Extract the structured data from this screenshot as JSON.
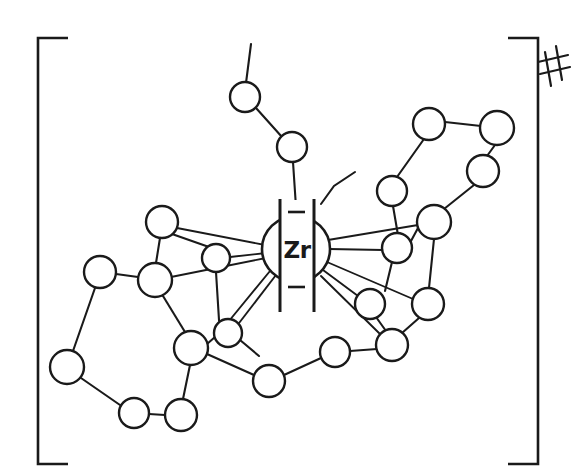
{
  "figure": {
    "kind": "chemical-structure-diagram",
    "style": "hand-drawn line drawing",
    "center_atom_label": "Zr",
    "charge_annotation": "#",
    "enclosure": "square-brackets",
    "line_color": "#1a1a1a",
    "node_fill": "#ffffff",
    "background": "#ffffff",
    "width": 588,
    "height": 475
  },
  "brackets": {
    "left": {
      "top_x": 68,
      "top_y": 37,
      "corner_x": 37,
      "bottom_y": 465,
      "bottom_x": 68
    },
    "right": {
      "top_x": 508,
      "top_y": 37,
      "corner_x": 539,
      "bottom_y": 465,
      "bottom_x": 508
    }
  },
  "charge": {
    "label": "#",
    "x": 552,
    "y": 64
  },
  "core": {
    "label": "Zr",
    "cx": 296,
    "cy": 249,
    "rx": 34,
    "ry": 33,
    "bar_left_x": 279,
    "bar_right_x": 315,
    "bar_top_y": 199,
    "bar_bottom_y": 312,
    "dash_top": {
      "x1": 288,
      "y1": 212,
      "x2": 304,
      "y2": 212
    },
    "dash_bottom": {
      "x1": 288,
      "y1": 287,
      "x2": 304,
      "y2": 287
    }
  },
  "atoms": [
    {
      "id": "a1",
      "x": 245,
      "y": 97,
      "r": 15,
      "group": "top-chain"
    },
    {
      "id": "a2",
      "x": 292,
      "y": 147,
      "r": 15,
      "group": "top-chain"
    },
    {
      "id": "a3",
      "x": 429,
      "y": 124,
      "r": 16,
      "group": "upper-right-ring"
    },
    {
      "id": "a4",
      "x": 497,
      "y": 128,
      "r": 17,
      "group": "upper-right-ring"
    },
    {
      "id": "a5",
      "x": 483,
      "y": 171,
      "r": 16,
      "group": "upper-right-ring"
    },
    {
      "id": "a6",
      "x": 392,
      "y": 191,
      "r": 15,
      "group": "upper-right-ring"
    },
    {
      "id": "a7",
      "x": 434,
      "y": 222,
      "r": 17,
      "group": "right-cluster"
    },
    {
      "id": "a8",
      "x": 397,
      "y": 248,
      "r": 15,
      "group": "right-cluster"
    },
    {
      "id": "a9",
      "x": 428,
      "y": 304,
      "r": 16,
      "group": "right-cluster"
    },
    {
      "id": "a10",
      "x": 370,
      "y": 304,
      "r": 15,
      "group": "right-cluster"
    },
    {
      "id": "a11",
      "x": 392,
      "y": 345,
      "r": 16,
      "group": "right-cluster"
    },
    {
      "id": "a12",
      "x": 335,
      "y": 352,
      "r": 15,
      "group": "bottom-chain"
    },
    {
      "id": "a13",
      "x": 269,
      "y": 381,
      "r": 16,
      "group": "bottom-chain"
    },
    {
      "id": "a14",
      "x": 162,
      "y": 222,
      "r": 16,
      "group": "left-cluster"
    },
    {
      "id": "a15",
      "x": 216,
      "y": 258,
      "r": 14,
      "group": "left-cluster"
    },
    {
      "id": "a16",
      "x": 155,
      "y": 280,
      "r": 17,
      "group": "left-cluster"
    },
    {
      "id": "a17",
      "x": 100,
      "y": 272,
      "r": 16,
      "group": "left-ring"
    },
    {
      "id": "a18",
      "x": 67,
      "y": 367,
      "r": 17,
      "group": "left-ring"
    },
    {
      "id": "a19",
      "x": 134,
      "y": 413,
      "r": 15,
      "group": "left-ring"
    },
    {
      "id": "a20",
      "x": 181,
      "y": 415,
      "r": 16,
      "group": "left-ring"
    },
    {
      "id": "a21",
      "x": 191,
      "y": 348,
      "r": 17,
      "group": "left-cluster"
    },
    {
      "id": "a22",
      "x": 228,
      "y": 333,
      "r": 14,
      "group": "left-cluster"
    }
  ],
  "bonds": [
    {
      "from": "free-top",
      "to": "a1",
      "x1": 251,
      "y1": 44,
      "x2": 246,
      "y2": 83
    },
    {
      "from": "a1",
      "to": "a2"
    },
    {
      "from": "a2",
      "to": "core-top",
      "x1": 293,
      "y1": 162,
      "x2": 296,
      "y2": 205
    },
    {
      "from": "core",
      "to": "stub-right-top",
      "x1": 320,
      "y1": 205,
      "x2": 333,
      "y2": 186,
      "x3": 354,
      "y3": 173
    },
    {
      "from": "a3",
      "to": "a4"
    },
    {
      "from": "a4",
      "to": "a5"
    },
    {
      "from": "a5",
      "to": "a7"
    },
    {
      "from": "a3",
      "to": "a6"
    },
    {
      "from": "a6",
      "to": "stub",
      "x1": 393,
      "y1": 206,
      "x2": 399,
      "y2": 240
    },
    {
      "from": "a7",
      "to": "a8"
    },
    {
      "from": "a7",
      "to": "a9"
    },
    {
      "from": "a8",
      "to": "stub",
      "x1": 392,
      "y1": 262,
      "x2": 385,
      "y2": 290
    },
    {
      "from": "a9",
      "to": "a11"
    },
    {
      "from": "a10",
      "to": "a11"
    },
    {
      "from": "a11",
      "to": "a12"
    },
    {
      "from": "a12",
      "to": "a13"
    },
    {
      "from": "core",
      "to": "a7",
      "x1": 328,
      "y1": 241,
      "x2": 418,
      "y2": 226
    },
    {
      "from": "core",
      "to": "a8",
      "x1": 328,
      "y1": 248,
      "x2": 383,
      "y2": 250
    },
    {
      "from": "core",
      "to": "a9",
      "x1": 327,
      "y1": 262,
      "x2": 413,
      "y2": 299
    },
    {
      "from": "core",
      "to": "a10",
      "x1": 322,
      "y1": 272,
      "x2": 359,
      "y2": 296
    },
    {
      "from": "core",
      "to": "a11",
      "x1": 320,
      "y1": 277,
      "x2": 380,
      "y2": 334
    },
    {
      "from": "core",
      "to": "a14",
      "x1": 266,
      "y1": 246,
      "x2": 177,
      "y2": 228
    },
    {
      "from": "core",
      "to": "a15",
      "x1": 266,
      "y1": 254,
      "x2": 230,
      "y2": 258
    },
    {
      "from": "core",
      "to": "a16",
      "x1": 266,
      "y1": 257,
      "x2": 171,
      "y2": 277
    },
    {
      "from": "core",
      "to": "a22a",
      "x1": 271,
      "y1": 272,
      "x2": 230,
      "y2": 322
    },
    {
      "from": "core",
      "to": "a22b",
      "x1": 276,
      "y1": 276,
      "x2": 236,
      "y2": 327
    },
    {
      "from": "a14",
      "to": "a15"
    },
    {
      "from": "a14",
      "to": "a16"
    },
    {
      "from": "a15",
      "to": "stub",
      "x1": 216,
      "y1": 272,
      "x2": 219,
      "y2": 320
    },
    {
      "from": "a16",
      "to": "a17"
    },
    {
      "from": "a16",
      "to": "a21"
    },
    {
      "from": "a17",
      "to": "a18"
    },
    {
      "from": "a18",
      "to": "a19"
    },
    {
      "from": "a19",
      "to": "a20"
    },
    {
      "from": "a20",
      "to": "a21"
    },
    {
      "from": "a21",
      "to": "a22"
    },
    {
      "from": "a21",
      "to": "a13"
    },
    {
      "from": "a22",
      "to": "stub",
      "x1": 240,
      "y1": 340,
      "x2": 258,
      "y2": 355
    }
  ]
}
